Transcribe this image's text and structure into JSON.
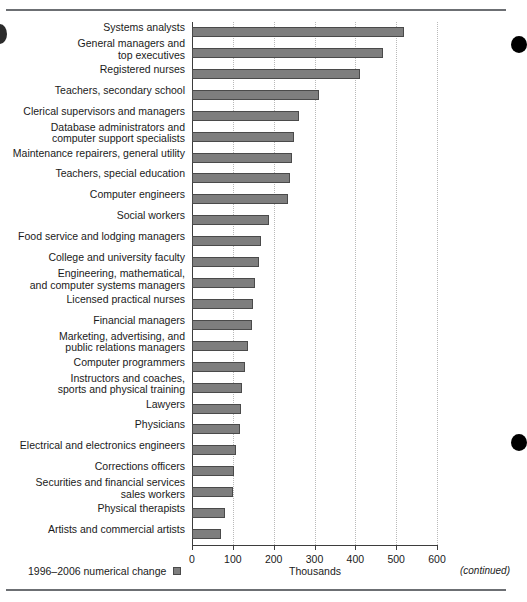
{
  "page": {
    "continued_note": "(continued)"
  },
  "legend": {
    "label": "1996–2006 numerical change",
    "swatch_color": "#7e7e7e"
  },
  "chart_data": {
    "type": "bar",
    "orientation": "horizontal",
    "title": "",
    "xlabel": "Thousands",
    "ylabel": "",
    "xlim": [
      0,
      600
    ],
    "xticks": [
      0,
      100,
      200,
      300,
      400,
      500,
      600
    ],
    "xtick_labels": [
      "0",
      "100",
      "200",
      "300",
      "400",
      "500",
      "600"
    ],
    "grid": true,
    "grid_axis": "x",
    "legend_position": "bottom-left",
    "series_name": "1996–2006 numerical change",
    "bar_color": "#7e7e7e",
    "bar_edge_color": "#4a4a4a",
    "categories": [
      "Systems analysts",
      "General managers and top executives",
      "Registered nurses",
      "Teachers, secondary school",
      "Clerical supervisors and managers",
      "Database administrators and computer support specialists",
      "Maintenance repairers, general utility",
      "Teachers, special education",
      "Computer engineers",
      "Social workers",
      "Food service and lodging managers",
      "College and university faculty",
      "Engineering, mathematical, and computer systems managers",
      "Licensed practical nurses",
      "Financial managers",
      "Marketing, advertising, and public relations managers",
      "Computer programmers",
      "Instructors and coaches, sports and physical training",
      "Lawyers",
      "Physicians",
      "Electrical and electronics engineers",
      "Corrections officers",
      "Securities and financial services sales workers",
      "Physical therapists",
      "Artists and commercial artists"
    ],
    "category_lines": [
      [
        "Systems analysts"
      ],
      [
        "General managers and",
        "top executives"
      ],
      [
        "Registered nurses"
      ],
      [
        "Teachers, secondary school"
      ],
      [
        "Clerical supervisors and managers"
      ],
      [
        "Database administrators and",
        "computer support specialists"
      ],
      [
        "Maintenance repairers, general utility"
      ],
      [
        "Teachers, special education"
      ],
      [
        "Computer engineers"
      ],
      [
        "Social workers"
      ],
      [
        "Food service and lodging managers"
      ],
      [
        "College and university faculty"
      ],
      [
        "Engineering, mathematical,",
        "and computer systems managers"
      ],
      [
        "Licensed practical nurses"
      ],
      [
        "Financial managers"
      ],
      [
        "Marketing, advertising, and",
        "public relations managers"
      ],
      [
        "Computer programmers"
      ],
      [
        "Instructors and coaches,",
        "sports and physical training"
      ],
      [
        "Lawyers"
      ],
      [
        "Physicians"
      ],
      [
        "Electrical and electronics engineers"
      ],
      [
        "Corrections officers"
      ],
      [
        "Securities and financial services",
        "sales workers"
      ],
      [
        "Physical therapists"
      ],
      [
        "Artists and commercial artists"
      ]
    ],
    "values": [
      520,
      467,
      411,
      312,
      261,
      249,
      246,
      241,
      235,
      188,
      169,
      163,
      155,
      149,
      146,
      138,
      129,
      123,
      119,
      117,
      107,
      103,
      100,
      81,
      71
    ]
  }
}
